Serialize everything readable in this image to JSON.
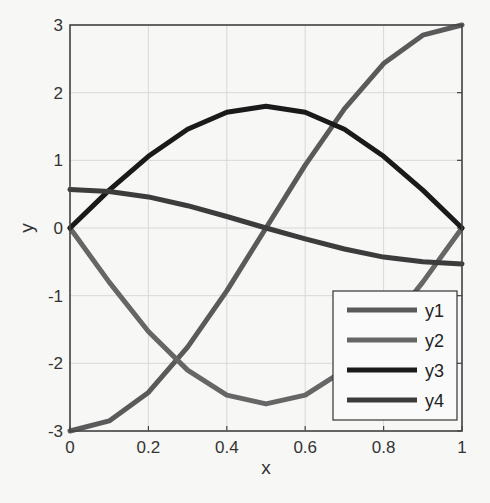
{
  "chart_data": {
    "type": "line",
    "title": "",
    "xlabel": "x",
    "ylabel": "y",
    "xlim": [
      0,
      1
    ],
    "ylim": [
      -3,
      3
    ],
    "grid": true,
    "legend_position": "lower right",
    "x_ticks": [
      "0",
      "0.2",
      "0.4",
      "0.6",
      "0.8",
      "1"
    ],
    "y_ticks": [
      "-3",
      "-2",
      "-1",
      "0",
      "1",
      "2",
      "3"
    ],
    "x": [
      0,
      0.1,
      0.2,
      0.3,
      0.4,
      0.5,
      0.6,
      0.7,
      0.8,
      0.9,
      1.0
    ],
    "series": [
      {
        "name": "y1",
        "color": "#5a5a5a",
        "values": [
          -3.0,
          -2.85,
          -2.43,
          -1.76,
          -0.93,
          0.0,
          0.93,
          1.76,
          2.43,
          2.85,
          3.0
        ]
      },
      {
        "name": "y2",
        "color": "#666666",
        "values": [
          0.0,
          -0.8,
          -1.53,
          -2.1,
          -2.47,
          -2.6,
          -2.47,
          -2.1,
          -1.53,
          -0.8,
          0.0
        ]
      },
      {
        "name": "y3",
        "color": "#1a1a1a",
        "values": [
          0.0,
          0.56,
          1.06,
          1.46,
          1.71,
          1.8,
          1.71,
          1.46,
          1.06,
          0.56,
          0.0
        ]
      },
      {
        "name": "y4",
        "color": "#3c3c3c",
        "values": [
          0.57,
          0.54,
          0.46,
          0.33,
          0.17,
          0.0,
          -0.16,
          -0.31,
          -0.43,
          -0.5,
          -0.53
        ]
      }
    ]
  }
}
